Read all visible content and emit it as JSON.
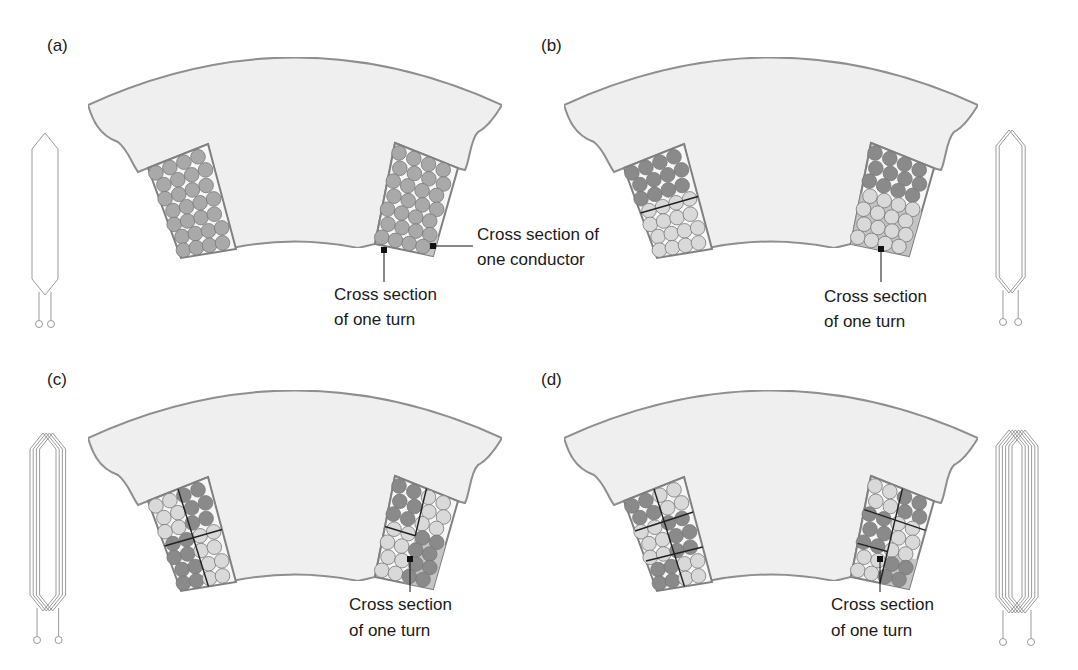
{
  "figure": {
    "colors": {
      "stator_fill": "#f2f2f2",
      "stator_stroke": "#8c8c8c",
      "slot_fill": "#f7f7f7",
      "slot_stroke": "#808080",
      "conductor_dark": "#8a8a8a",
      "conductor_mid": "#a9a9a9",
      "conductor_light": "#d9d9d9",
      "turn_highlight": "#c4c4c4",
      "divider": "#222222",
      "coil": "#9a9a9a",
      "leader": "#111111"
    },
    "panels": [
      {
        "id": "a",
        "label": "(a)",
        "turns": 1,
        "annotations": [
          {
            "line1": "Cross section of",
            "line2": "one conductor"
          },
          {
            "line1": "Cross section",
            "line2": "of one turn"
          }
        ]
      },
      {
        "id": "b",
        "label": "(b)",
        "turns": 2,
        "annotations": [
          {
            "line1": "Cross section",
            "line2": "of one turn"
          }
        ]
      },
      {
        "id": "c",
        "label": "(c)",
        "turns": 4,
        "annotations": [
          {
            "line1": "Cross section",
            "line2": "of one turn"
          }
        ]
      },
      {
        "id": "d",
        "label": "(d)",
        "turns": 6,
        "annotations": [
          {
            "line1": "Cross section",
            "line2": "of one turn"
          }
        ]
      }
    ]
  }
}
